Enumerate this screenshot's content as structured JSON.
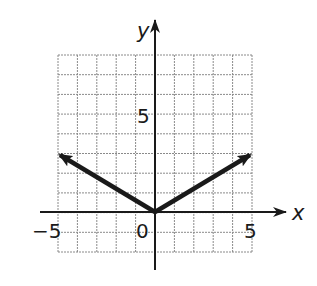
{
  "chart_data": {
    "type": "line",
    "title": "",
    "xlabel": "x",
    "ylabel": "y",
    "xlim": [
      -5,
      5
    ],
    "ylim": [
      -2,
      8
    ],
    "grid": true,
    "grid_step": 1,
    "tick_labels": {
      "x": [
        "-5",
        "0",
        "5"
      ],
      "y": [
        "5"
      ]
    },
    "series": [
      {
        "name": "absolute value graph",
        "x": [
          -5,
          0,
          5
        ],
        "y": [
          3,
          0,
          3
        ],
        "arrows": "both ends"
      }
    ]
  },
  "labels": {
    "x_axis": "x",
    "y_axis": "y",
    "origin": "0",
    "x_neg5": "−5",
    "x_pos5": "5",
    "y_pos5": "5"
  },
  "colors": {
    "grid": "#8a8a8a",
    "axis": "#1a1a1a",
    "curve": "#1a1a1a"
  }
}
